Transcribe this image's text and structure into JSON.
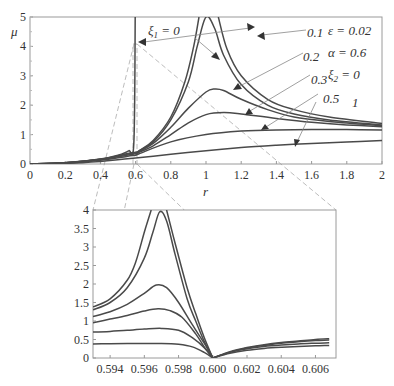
{
  "chart_data": [
    {
      "type": "line",
      "title": "",
      "xlabel": "r",
      "ylabel": "μ",
      "xlim": [
        0,
        2
      ],
      "ylim": [
        0,
        5
      ],
      "xticks": [
        "0",
        "0.2",
        "0.4",
        "0.6",
        "0.8",
        "1",
        "1.2",
        "1.4",
        "1.6",
        "1.8",
        "2"
      ],
      "yticks": [
        "0",
        "1",
        "2",
        "3",
        "4",
        "5"
      ],
      "grid": false,
      "parameters": [
        "ε = 0.02",
        "α = 0.6",
        "ξ2 = 0"
      ],
      "series_labels": [
        "ξ1 = 0",
        "0.1",
        "0.2",
        "0.3",
        "0.5",
        "1"
      ],
      "series": [
        {
          "name": "ξ1 = 0 (a)",
          "x": [
            0,
            0.2,
            0.4,
            0.5,
            0.56,
            0.59,
            0.598
          ],
          "values": [
            0,
            0.04,
            0.17,
            0.3,
            0.45,
            0.7,
            5
          ]
        },
        {
          "name": "ξ1 = 0 (b)",
          "x": [
            0.602,
            0.62,
            0.7,
            0.8,
            0.88,
            0.93,
            0.96
          ],
          "values": [
            0.3,
            0.45,
            0.8,
            1.6,
            2.8,
            4.0,
            5
          ]
        },
        {
          "name": "ξ1 = 0 (c)",
          "x": [
            1.07,
            1.12,
            1.2,
            1.35,
            1.5,
            1.7,
            2
          ],
          "values": [
            5,
            3.9,
            3.0,
            2.2,
            1.85,
            1.6,
            1.38
          ]
        },
        {
          "name": "0.1",
          "x": [
            0,
            0.2,
            0.4,
            0.55,
            0.6,
            0.62,
            0.7,
            0.8,
            0.9,
            0.95,
            1.0,
            1.05,
            1.1,
            1.2,
            1.35,
            1.5,
            1.7,
            2
          ],
          "values": [
            0,
            0.04,
            0.16,
            0.35,
            0.4,
            0.45,
            0.75,
            1.5,
            2.8,
            4.0,
            5,
            4.6,
            3.7,
            2.7,
            2.0,
            1.7,
            1.5,
            1.33
          ]
        },
        {
          "name": "0.2",
          "x": [
            0,
            0.2,
            0.4,
            0.55,
            0.6,
            0.62,
            0.7,
            0.8,
            0.9,
            1.0,
            1.05,
            1.1,
            1.2,
            1.35,
            1.5,
            1.7,
            2
          ],
          "values": [
            0,
            0.04,
            0.16,
            0.33,
            0.38,
            0.43,
            0.7,
            1.25,
            1.9,
            2.45,
            2.55,
            2.5,
            2.2,
            1.85,
            1.6,
            1.45,
            1.3
          ]
        },
        {
          "name": "0.3",
          "x": [
            0,
            0.2,
            0.4,
            0.55,
            0.6,
            0.62,
            0.7,
            0.8,
            0.9,
            1.0,
            1.1,
            1.2,
            1.4,
            1.6,
            1.8,
            2
          ],
          "values": [
            0,
            0.04,
            0.15,
            0.3,
            0.35,
            0.4,
            0.62,
            1.0,
            1.4,
            1.68,
            1.75,
            1.7,
            1.55,
            1.42,
            1.33,
            1.27
          ]
        },
        {
          "name": "0.5",
          "x": [
            0,
            0.2,
            0.4,
            0.55,
            0.6,
            0.62,
            0.8,
            1.0,
            1.2,
            1.4,
            1.6,
            1.8,
            2
          ],
          "values": [
            0,
            0.03,
            0.13,
            0.26,
            0.3,
            0.35,
            0.75,
            1.0,
            1.12,
            1.16,
            1.17,
            1.17,
            1.16
          ]
        },
        {
          "name": "1",
          "x": [
            0,
            0.2,
            0.4,
            0.6,
            0.8,
            1.0,
            1.2,
            1.4,
            1.6,
            1.8,
            2
          ],
          "values": [
            0,
            0.02,
            0.09,
            0.2,
            0.33,
            0.45,
            0.56,
            0.64,
            0.7,
            0.75,
            0.8
          ]
        }
      ],
      "zoom_box": {
        "x": [
          0.593,
          0.607
        ],
        "y": [
          0,
          4
        ]
      }
    },
    {
      "type": "line",
      "title": "inset",
      "xlabel": "",
      "ylabel": "",
      "xlim": [
        0.593,
        0.6072
      ],
      "ylim": [
        0,
        4
      ],
      "xticks": [
        "0.594",
        "0.596",
        "0.598",
        "0.600",
        "0.602",
        "0.604",
        "0.606"
      ],
      "yticks": [
        "0",
        "0.5",
        "1",
        "1.5",
        "2",
        "2.5",
        "3",
        "3.5",
        "4"
      ],
      "series": [
        {
          "name": "ξ1 = 0",
          "x": [
            0.593,
            0.594,
            0.595,
            0.5955,
            0.596,
            0.5964
          ],
          "values": [
            1.38,
            1.6,
            2.1,
            2.6,
            3.4,
            4
          ]
        },
        {
          "name": "ξ1 = 0 (right)",
          "x": [
            0.5973,
            0.5978,
            0.5985,
            0.599,
            0.5995,
            0.6
          ],
          "values": [
            4,
            3.1,
            1.9,
            1.2,
            0.55,
            0
          ]
        },
        {
          "name": "0.1",
          "x": [
            0.593,
            0.594,
            0.595,
            0.596,
            0.5965,
            0.5969,
            0.5973,
            0.5978,
            0.5985,
            0.599,
            0.5995,
            0.6
          ],
          "values": [
            1.3,
            1.5,
            1.9,
            2.7,
            3.4,
            3.95,
            3.7,
            2.8,
            1.6,
            1.0,
            0.45,
            0
          ]
        },
        {
          "name": "0.2",
          "x": [
            0.593,
            0.594,
            0.595,
            0.596,
            0.5967,
            0.5973,
            0.598,
            0.5988,
            0.5995,
            0.6
          ],
          "values": [
            1.12,
            1.25,
            1.45,
            1.75,
            1.97,
            1.9,
            1.5,
            0.9,
            0.4,
            0
          ]
        },
        {
          "name": "0.3",
          "x": [
            0.593,
            0.594,
            0.595,
            0.596,
            0.5968,
            0.5975,
            0.5982,
            0.599,
            0.5995,
            0.6
          ],
          "values": [
            0.95,
            1.05,
            1.15,
            1.27,
            1.33,
            1.28,
            1.1,
            0.65,
            0.3,
            0
          ]
        },
        {
          "name": "0.5",
          "x": [
            0.593,
            0.594,
            0.595,
            0.596,
            0.597,
            0.598,
            0.5988,
            0.5995,
            0.6
          ],
          "values": [
            0.7,
            0.72,
            0.75,
            0.78,
            0.8,
            0.75,
            0.55,
            0.28,
            0
          ]
        },
        {
          "name": "1",
          "x": [
            0.593,
            0.595,
            0.597,
            0.598,
            0.5988,
            0.5995,
            0.6
          ],
          "values": [
            0.38,
            0.39,
            0.39,
            0.37,
            0.3,
            0.15,
            0
          ]
        },
        {
          "name": "right-a",
          "x": [
            0.6,
            0.601,
            0.602,
            0.603,
            0.604,
            0.605,
            0.606,
            0.6068
          ],
          "values": [
            0,
            0.17,
            0.28,
            0.36,
            0.42,
            0.46,
            0.5,
            0.52
          ]
        },
        {
          "name": "right-b",
          "x": [
            0.6,
            0.601,
            0.602,
            0.603,
            0.604,
            0.605,
            0.606,
            0.6068
          ],
          "values": [
            0,
            0.16,
            0.27,
            0.34,
            0.4,
            0.44,
            0.47,
            0.49
          ]
        },
        {
          "name": "right-c",
          "x": [
            0.6,
            0.601,
            0.602,
            0.603,
            0.604,
            0.605,
            0.606,
            0.6068
          ],
          "values": [
            0,
            0.15,
            0.25,
            0.31,
            0.35,
            0.38,
            0.4,
            0.41
          ]
        },
        {
          "name": "right-d",
          "x": [
            0.6,
            0.601,
            0.602,
            0.603,
            0.604,
            0.605,
            0.606,
            0.6068
          ],
          "values": [
            0,
            0.13,
            0.21,
            0.26,
            0.29,
            0.31,
            0.33,
            0.34
          ]
        }
      ]
    }
  ],
  "labels": {
    "y_axis": "μ",
    "x_axis": "r",
    "xi1": "ξ",
    "xi1_sub": "1",
    "xi1_eq": " = 0",
    "l01": "0.1",
    "l02": "0.2",
    "l03": "0.3",
    "l05": "0.5",
    "l1": "1",
    "eps": "ε = 0.02",
    "alpha": "α = 0.6",
    "xi2": "ξ",
    "xi2_sub": "2",
    "xi2_eq": " = 0"
  }
}
